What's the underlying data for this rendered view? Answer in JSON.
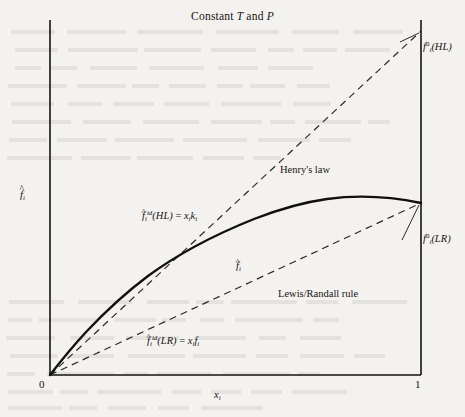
{
  "figure": {
    "title_prefix": "Constant ",
    "title_var1": "T",
    "title_mid": " and ",
    "title_var2": "P"
  },
  "axes": {
    "x_label_base": "x",
    "x_label_sub": "i",
    "y_label_base": "f",
    "y_label_sub": "i",
    "y_label_hat": "^",
    "x_tick_min": "0",
    "x_tick_max": "1"
  },
  "annotations": {
    "henrys_law": "Henry's law",
    "lewis_randall": "Lewis/Randall rule",
    "hl_ref_base": "f",
    "hl_ref_sub": "i",
    "hl_ref_sup": "0",
    "hl_ref_paren": "(HL)",
    "lr_ref_base": "f",
    "lr_ref_sub": "i",
    "lr_ref_sup": "0",
    "lr_ref_paren": "(LR)",
    "id_hl_base": "f",
    "id_hl_sub": "i",
    "id_hl_sup": "id",
    "id_hl_paren": "(HL)",
    "id_hl_eq": " = ",
    "id_hl_rhs_x": "x",
    "id_hl_rhs_xsub": "i",
    "id_hl_rhs_k": "k",
    "id_hl_rhs_ksub": "i",
    "id_lr_base": "f",
    "id_lr_sub": "i",
    "id_lr_sup": "id",
    "id_lr_paren": "(LR)",
    "id_lr_eq": " = ",
    "id_lr_rhs_x": "x",
    "id_lr_rhs_xsub": "i",
    "id_lr_rhs_f": "f",
    "id_lr_rhs_fsub": "i",
    "curve_base": "f",
    "curve_sub": "i",
    "hat": "^"
  },
  "colors": {
    "ink": "#141414",
    "page": "#f4f2ee",
    "curve": "#101010",
    "dashed": "#2a2a2a"
  },
  "chart_data": {
    "type": "line",
    "title": "Constant T and P",
    "xlabel": "x_i",
    "ylabel": "f-hat_i",
    "xlim": [
      0,
      1
    ],
    "ylim": [
      0,
      1
    ],
    "xticks": [
      0,
      1
    ],
    "xticklabels": [
      "0",
      "1"
    ],
    "yticks": [],
    "grid": false,
    "legend": "none (inline annotations)",
    "series": [
      {
        "name": "f-hat_i (actual fugacity)",
        "style": "solid",
        "x": [
          0.0,
          0.05,
          0.1,
          0.15,
          0.2,
          0.25,
          0.3,
          0.35,
          0.4,
          0.45,
          0.5,
          0.55,
          0.6,
          0.65,
          0.7,
          0.75,
          0.8,
          0.85,
          0.9,
          0.95,
          1.0
        ],
        "y": [
          0.0,
          0.046,
          0.086,
          0.122,
          0.155,
          0.185,
          0.213,
          0.239,
          0.263,
          0.286,
          0.308,
          0.329,
          0.349,
          0.368,
          0.387,
          0.405,
          0.422,
          0.439,
          0.455,
          0.47,
          0.483
        ]
      },
      {
        "name": "f-hat_i^id(HL) = x_i k_i  (Henry's law)",
        "style": "dashed",
        "x": [
          0.0,
          1.0
        ],
        "y": [
          0.0,
          0.968
        ]
      },
      {
        "name": "f-hat_i^id(LR) = x_i f_i  (Lewis/Randall rule)",
        "style": "dashed",
        "x": [
          0.0,
          1.0
        ],
        "y": [
          0.0,
          0.483
        ]
      }
    ],
    "annotations": [
      {
        "text": "f_i^0(HL)",
        "x": 1.0,
        "y": 0.968,
        "position": "right of axis"
      },
      {
        "text": "f_i^0(LR)",
        "x": 1.0,
        "y": 0.483,
        "position": "right of axis"
      },
      {
        "text": "Henry's law",
        "x": 0.63,
        "y": 0.6
      },
      {
        "text": "Lewis/Randall rule",
        "x": 0.62,
        "y": 0.25
      },
      {
        "text": "f-hat_i^id(HL) = x_i k_i",
        "x": 0.3,
        "y": 0.47
      },
      {
        "text": "f-hat_i^id(LR) = x_i f_i",
        "x": 0.32,
        "y": 0.12
      },
      {
        "text": "f-hat_i",
        "x": 0.52,
        "y": 0.33
      }
    ]
  }
}
